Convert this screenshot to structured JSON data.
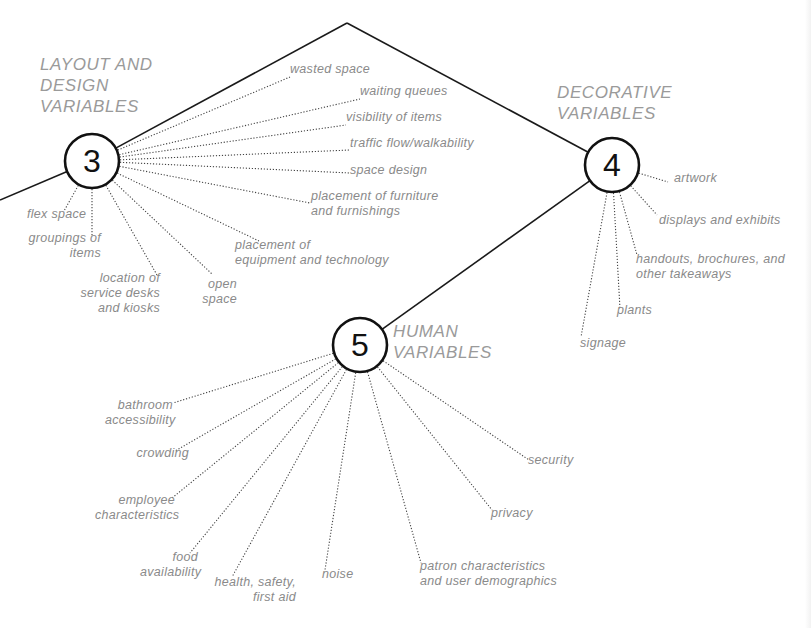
{
  "diagram": {
    "colors": {
      "line": "#1a1a1a",
      "dotted": "#444444",
      "label": "#8a8a8a",
      "title": "#9a9a9a"
    },
    "spine": {
      "points": [
        [
          0,
          200
        ],
        [
          92,
          161
        ],
        [
          347,
          23
        ],
        [
          612,
          165
        ],
        [
          360,
          345
        ]
      ]
    },
    "nodes": [
      {
        "id": "layout",
        "number": "3",
        "cx": 92,
        "cy": 161,
        "r": 27,
        "title": [
          "LAYOUT AND",
          "DESIGN",
          "VARIABLES"
        ],
        "title_pos": [
          40,
          54
        ],
        "items": [
          {
            "text": [
              "wasted space"
            ],
            "x": 290,
            "y": 69,
            "ax": 290,
            "ay": 77,
            "align": "left"
          },
          {
            "text": [
              "waiting queues"
            ],
            "x": 360,
            "y": 91,
            "ax": 360,
            "ay": 99,
            "align": "left"
          },
          {
            "text": [
              "visibility of items"
            ],
            "x": 346,
            "y": 117,
            "ax": 346,
            "ay": 125,
            "align": "left"
          },
          {
            "text": [
              "traffic flow/walkability"
            ],
            "x": 350,
            "y": 143,
            "ax": 350,
            "ay": 150,
            "align": "left"
          },
          {
            "text": [
              "space design"
            ],
            "x": 350,
            "y": 170,
            "ax": 350,
            "ay": 173,
            "align": "left"
          },
          {
            "text": [
              "placement of furniture",
              "and furnishings"
            ],
            "x": 311,
            "y": 196,
            "ax": 310,
            "ay": 203,
            "align": "left"
          },
          {
            "text": [
              "flex space"
            ],
            "x": 27,
            "y": 214,
            "ax": 64,
            "ay": 211,
            "align": "left",
            "anchor_end": [
              64,
              178
            ]
          },
          {
            "text": [
              "groupings of",
              "items"
            ],
            "x": 28,
            "y": 238,
            "ax": 92,
            "ay": 237,
            "align": "right",
            "w": 73
          },
          {
            "text": [
              "location of",
              "service desks",
              "and kiosks"
            ],
            "x": 80,
            "y": 278,
            "ax": 157,
            "ay": 275,
            "align": "right",
            "w": 80
          },
          {
            "text": [
              "open",
              "space"
            ],
            "x": 200,
            "y": 284,
            "ax": 212,
            "ay": 274,
            "align": "right",
            "w": 37
          },
          {
            "text": [
              "placement of",
              "equipment and technology"
            ],
            "x": 235,
            "y": 245,
            "ax": 259,
            "ay": 241,
            "align": "left"
          }
        ]
      },
      {
        "id": "decorative",
        "number": "4",
        "cx": 612,
        "cy": 165,
        "r": 27,
        "title": [
          "DECORATIVE",
          "VARIABLES"
        ],
        "title_pos": [
          557,
          82
        ],
        "items": [
          {
            "text": [
              "artwork"
            ],
            "x": 674,
            "y": 178,
            "ax": 668,
            "ay": 182,
            "align": "left"
          },
          {
            "text": [
              "displays and exhibits"
            ],
            "x": 659,
            "y": 220,
            "ax": 657,
            "ay": 215,
            "align": "left"
          },
          {
            "text": [
              "handouts, brochures, and",
              "other takeaways"
            ],
            "x": 636,
            "y": 259,
            "ax": 637,
            "ay": 255,
            "align": "left"
          },
          {
            "text": [
              "plants"
            ],
            "x": 617,
            "y": 310,
            "ax": 620,
            "ay": 309,
            "align": "left"
          },
          {
            "text": [
              "signage"
            ],
            "x": 580,
            "y": 343,
            "ax": 581,
            "ay": 337,
            "align": "left"
          }
        ]
      },
      {
        "id": "human",
        "number": "5",
        "cx": 360,
        "cy": 345,
        "r": 27,
        "title": [
          "HUMAN",
          "VARIABLES"
        ],
        "title_pos": [
          393,
          321
        ],
        "items": [
          {
            "text": [
              "bathroom",
              "accessibility"
            ],
            "x": 105,
            "y": 405,
            "ax": 173,
            "ay": 403,
            "align": "right",
            "w": 68
          },
          {
            "text": [
              "crowding"
            ],
            "x": 125,
            "y": 453,
            "ax": 175,
            "ay": 451,
            "align": "right",
            "w": 64
          },
          {
            "text": [
              "employee",
              "characteristics"
            ],
            "x": 95,
            "y": 500,
            "ax": 172,
            "ay": 498,
            "align": "right",
            "w": 80
          },
          {
            "text": [
              "food",
              "availability"
            ],
            "x": 140,
            "y": 557,
            "ax": 190,
            "ay": 553,
            "align": "right",
            "w": 58
          },
          {
            "text": [
              "health, safety,",
              "first aid"
            ],
            "x": 212,
            "y": 582,
            "ax": 232,
            "ay": 577,
            "align": "right",
            "w": 84
          },
          {
            "text": [
              "noise"
            ],
            "x": 322,
            "y": 574,
            "ax": 325,
            "ay": 570,
            "align": "left"
          },
          {
            "text": [
              "patron characteristics",
              "and user demographics"
            ],
            "x": 420,
            "y": 566,
            "ax": 421,
            "ay": 563,
            "align": "left"
          },
          {
            "text": [
              "privacy"
            ],
            "x": 491,
            "y": 513,
            "ax": 492,
            "ay": 510,
            "align": "left"
          },
          {
            "text": [
              "security"
            ],
            "x": 528,
            "y": 460,
            "ax": 529,
            "ay": 460,
            "align": "left"
          }
        ]
      }
    ]
  }
}
